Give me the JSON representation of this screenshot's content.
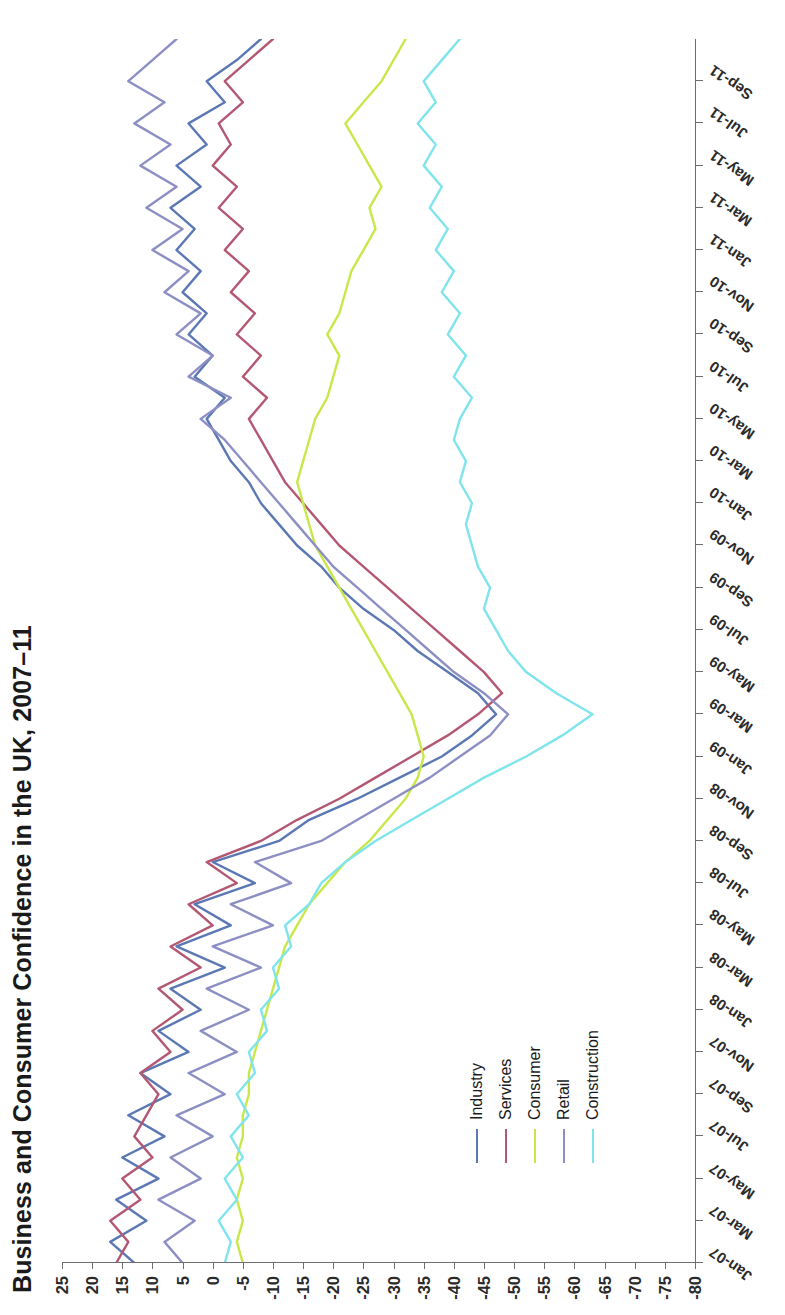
{
  "title": "Business and Consumer Confidence in the UK, 2007–11",
  "axes": {
    "y_ticks": [
      25,
      20,
      15,
      10,
      5,
      0,
      -5,
      -10,
      -15,
      -20,
      -25,
      -30,
      -35,
      -40,
      -45,
      -50,
      -55,
      -60,
      -65,
      -70,
      -75,
      -80
    ],
    "y_tick_labels": [
      "25",
      "20",
      "15",
      "10",
      "5",
      "0",
      "-5",
      "-10",
      "-15",
      "-20",
      "-25",
      "-30",
      "-35",
      "-40",
      "-45",
      "-50",
      "-55",
      "-60",
      "-65",
      "-70",
      "-75",
      "-80"
    ],
    "x_tick_labels": [
      "Jan-07",
      "Mar-07",
      "May-07",
      "Jul-07",
      "Sep-07",
      "Nov-07",
      "Jan-08",
      "Mar-08",
      "May-08",
      "Jul-08",
      "Sep-08",
      "Nov-08",
      "Jan-09",
      "Mar-09",
      "May-09",
      "Jul-09",
      "Sep-09",
      "Nov-09",
      "Jan-10",
      "Mar-10",
      "May-10",
      "Jul-10",
      "Sep-10",
      "Nov-10",
      "Jan-11",
      "Mar-11",
      "May-11",
      "Jul-11",
      "Sep-11"
    ]
  },
  "legend": {
    "position": "inside-bottom-left",
    "items": [
      {
        "label": "Industry",
        "color": "#5b78b4"
      },
      {
        "label": "Services",
        "color": "#b35872"
      },
      {
        "label": "Consumer",
        "color": "#c8e84a"
      },
      {
        "label": "Retail",
        "color": "#8d8fc4"
      },
      {
        "label": "Construction",
        "color": "#7fe4ec"
      }
    ]
  },
  "chart_data": {
    "type": "line",
    "title": "Business and Consumer Confidence in the UK, 2007–11",
    "xlabel": "",
    "ylabel": "",
    "ylim": [
      -80,
      25
    ],
    "ystep": 5,
    "grid": false,
    "legend_position": "inside-bottom-left",
    "x": [
      "Jan-07",
      "Feb-07",
      "Mar-07",
      "Apr-07",
      "May-07",
      "Jun-07",
      "Jul-07",
      "Aug-07",
      "Sep-07",
      "Oct-07",
      "Nov-07",
      "Dec-07",
      "Jan-08",
      "Feb-08",
      "Mar-08",
      "Apr-08",
      "May-08",
      "Jun-08",
      "Jul-08",
      "Aug-08",
      "Sep-08",
      "Oct-08",
      "Nov-08",
      "Dec-08",
      "Jan-09",
      "Feb-09",
      "Mar-09",
      "Apr-09",
      "May-09",
      "Jun-09",
      "Jul-09",
      "Aug-09",
      "Sep-09",
      "Oct-09",
      "Nov-09",
      "Dec-09",
      "Jan-10",
      "Feb-10",
      "Mar-10",
      "Apr-10",
      "May-10",
      "Jun-10",
      "Jul-10",
      "Aug-10",
      "Sep-10",
      "Oct-10",
      "Nov-10",
      "Dec-10",
      "Jan-11",
      "Feb-11",
      "Mar-11",
      "Apr-11",
      "May-11",
      "Jun-11",
      "Jul-11",
      "Aug-11",
      "Sep-11",
      "Oct-11",
      "Nov-11"
    ],
    "series": [
      {
        "name": "Industry",
        "color": "#5b78b4",
        "values": [
          13,
          17,
          11,
          16,
          9,
          15,
          8,
          14,
          7,
          12,
          4,
          9,
          2,
          7,
          -2,
          6,
          -3,
          3,
          -7,
          0,
          -11,
          -16,
          -24,
          -31,
          -38,
          -43,
          -47,
          -44,
          -39,
          -34,
          -30,
          -25,
          -21,
          -18,
          -14,
          -11,
          -8,
          -6,
          -3,
          -1,
          1,
          -2,
          3,
          0,
          4,
          1,
          5,
          2,
          6,
          3,
          7,
          2,
          6,
          1,
          4,
          -2,
          1,
          -4,
          -8
        ]
      },
      {
        "name": "Services",
        "color": "#b35872",
        "values": [
          16,
          14,
          17,
          12,
          15,
          10,
          13,
          11,
          9,
          12,
          7,
          10,
          5,
          9,
          2,
          7,
          0,
          4,
          -4,
          1,
          -8,
          -14,
          -21,
          -27,
          -33,
          -39,
          -44,
          -48,
          -45,
          -41,
          -37,
          -33,
          -29,
          -25,
          -21,
          -18,
          -15,
          -12,
          -10,
          -8,
          -6,
          -9,
          -5,
          -8,
          -4,
          -7,
          -3,
          -6,
          -2,
          -5,
          -1,
          -4,
          0,
          -3,
          -1,
          -5,
          -2,
          -6,
          -10
        ]
      },
      {
        "name": "Consumer",
        "color": "#c8e84a",
        "values": [
          -5,
          -4,
          -5,
          -4,
          -5,
          -4,
          -5,
          -5,
          -6,
          -6,
          -7,
          -8,
          -9,
          -10,
          -11,
          -12,
          -14,
          -16,
          -19,
          -22,
          -26,
          -29,
          -32,
          -34,
          -35,
          -34,
          -33,
          -31,
          -29,
          -27,
          -25,
          -23,
          -21,
          -19,
          -17,
          -16,
          -15,
          -14,
          -15,
          -16,
          -17,
          -19,
          -20,
          -21,
          -19,
          -21,
          -22,
          -23,
          -25,
          -27,
          -26,
          -28,
          -26,
          -24,
          -22,
          -25,
          -28,
          -30,
          -32
        ]
      },
      {
        "name": "Retail",
        "color": "#8d8fc4",
        "values": [
          5,
          8,
          3,
          9,
          2,
          7,
          0,
          6,
          -2,
          4,
          -4,
          2,
          -6,
          1,
          -8,
          0,
          -10,
          -3,
          -13,
          -7,
          -18,
          -24,
          -30,
          -36,
          -41,
          -46,
          -49,
          -45,
          -40,
          -36,
          -32,
          -28,
          -24,
          -20,
          -17,
          -14,
          -11,
          -8,
          -5,
          -2,
          2,
          -3,
          4,
          0,
          6,
          2,
          8,
          4,
          10,
          5,
          11,
          6,
          12,
          7,
          13,
          8,
          14,
          10,
          6
        ]
      },
      {
        "name": "Construction",
        "color": "#7fe4ec",
        "values": [
          -2,
          -3,
          -1,
          -4,
          -2,
          -5,
          -3,
          -6,
          -4,
          -7,
          -6,
          -9,
          -8,
          -11,
          -10,
          -13,
          -12,
          -16,
          -18,
          -22,
          -27,
          -33,
          -39,
          -45,
          -52,
          -58,
          -63,
          -57,
          -52,
          -49,
          -47,
          -45,
          -46,
          -44,
          -43,
          -42,
          -43,
          -41,
          -42,
          -40,
          -41,
          -43,
          -40,
          -42,
          -39,
          -41,
          -38,
          -40,
          -37,
          -39,
          -36,
          -38,
          -35,
          -37,
          -34,
          -37,
          -35,
          -38,
          -41
        ]
      }
    ]
  }
}
